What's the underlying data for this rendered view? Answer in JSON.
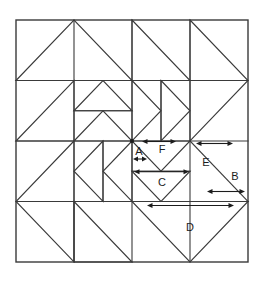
{
  "figure": {
    "type": "geometric-diagram",
    "background_color": "#ffffff",
    "line_color": "#3a3a3a",
    "arrow_color": "#1c1c1c"
  },
  "frame": {
    "x": 16,
    "y": 20,
    "width": 232,
    "height": 242,
    "rows": 4,
    "cols": 4
  },
  "labels": [
    {
      "id": "A",
      "text": "A",
      "x": 139,
      "y": 152
    },
    {
      "id": "F",
      "text": "F",
      "x": 162,
      "y": 150
    },
    {
      "id": "C",
      "text": "C",
      "x": 162,
      "y": 183
    },
    {
      "id": "E",
      "text": "E",
      "x": 206,
      "y": 163
    },
    {
      "id": "B",
      "text": "B",
      "x": 235,
      "y": 177
    },
    {
      "id": "D",
      "text": "D",
      "x": 190,
      "y": 228
    }
  ],
  "dimension_arrows": [
    {
      "id": "A",
      "x1": 134,
      "x2": 146,
      "y": 159,
      "span_px": 12
    },
    {
      "id": "F",
      "x1": 143,
      "x2": 175,
      "y": 141,
      "span_px": 32
    },
    {
      "id": "C",
      "x1": 134,
      "x2": 190,
      "y": 171,
      "span_px": 56
    },
    {
      "id": "E",
      "x1": 196,
      "x2": 233,
      "y": 143,
      "span_px": 37
    },
    {
      "id": "B",
      "x1": 207,
      "x2": 245,
      "y": 191,
      "span_px": 38
    },
    {
      "id": "D",
      "x1": 147,
      "x2": 234,
      "y": 205,
      "span_px": 87
    }
  ],
  "grid_lines": {
    "vertical_x": [
      16,
      74,
      132,
      190,
      248
    ],
    "horizontal_y": [
      20,
      80.5,
      141,
      201.5,
      262
    ]
  },
  "shapes": {
    "top_left_big_triangle": "apex-up spanning two cells",
    "top_right_big_triangle": "apex-right spanning two cells",
    "bottom_left_big_triangle": "apex-left spanning two cells",
    "bottom_right_big_triangle": "apex-down spanning two cells, label D"
  }
}
